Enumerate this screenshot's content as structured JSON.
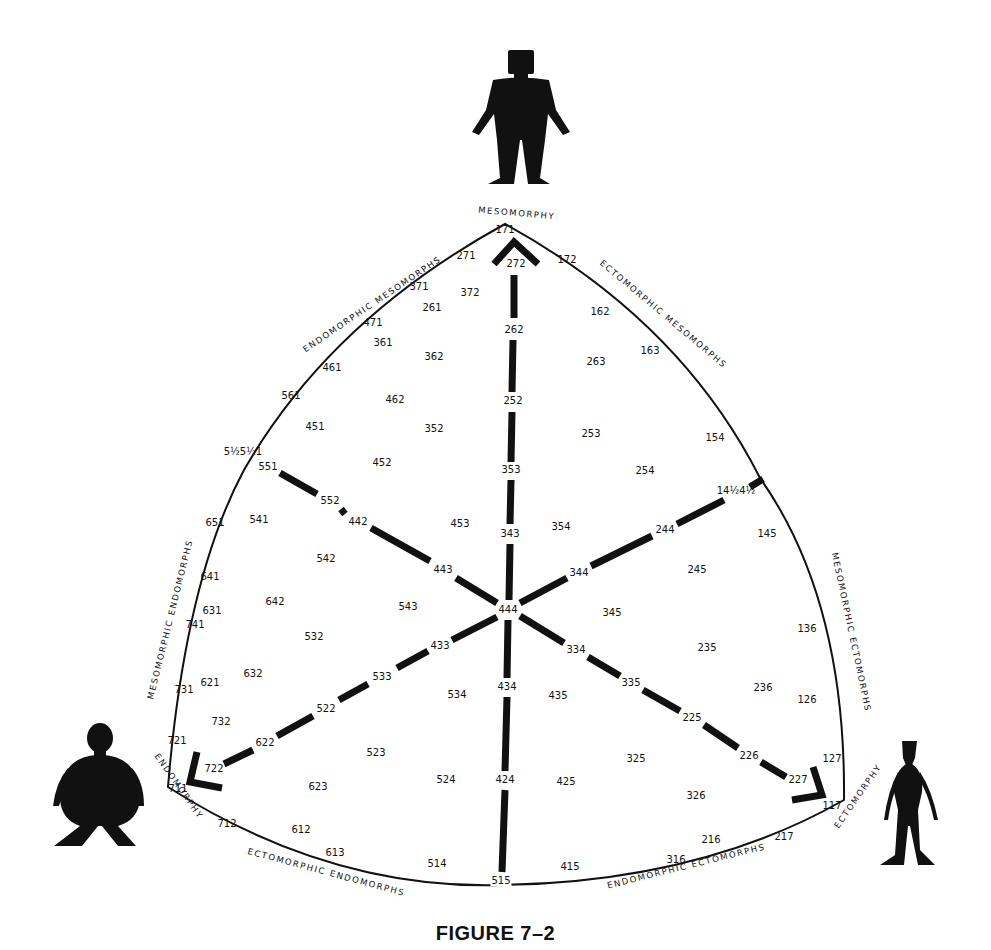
{
  "figure": {
    "caption": "FIGURE 7–2"
  },
  "poles": {
    "mesomorphy": {
      "label": "MESOMORPHY",
      "code": "171",
      "silhouette": "muscular-figure"
    },
    "endomorphy": {
      "label": "ENDOMORPHY",
      "code": "711",
      "silhouette": "round-figure"
    },
    "ectomorphy": {
      "label": "ECTOMORPHY",
      "code": "117",
      "silhouette": "thin-figure"
    }
  },
  "center": "444",
  "region_labels": {
    "endomorphic_mesomorphs": "ENDOMORPHIC  MESOMORPHS",
    "ectomorphic_mesomorphs": "ECTOMORPHIC  MESOMORPHS",
    "mesomorphic_endomorphs": "MESOMORPHIC  ENDOMORPHS",
    "mesomorphic_ectomorphs": "MESOMORPHIC  ECTOMORPHS",
    "ectomorphic_endomorphs": "ECTOMORPHIC  ENDOMORPHS",
    "endomorphic_ectomorphs": "ENDOMORPHIC  ECTOMORPHS"
  },
  "axes": {
    "to_mesomorphy": [
      "444",
      "343",
      "353",
      "252",
      "262",
      "272"
    ],
    "to_endomorphy": [
      "444",
      "433",
      "533",
      "522",
      "622",
      "722"
    ],
    "to_ectomorphy": [
      "444",
      "334",
      "335",
      "225",
      "226",
      "227"
    ],
    "to_endomorphic_mesomorph_edge": [
      "444",
      "443",
      "442",
      "552",
      "551"
    ],
    "to_mesomorphic_ectomorph_edge": [
      "444",
      "344",
      "244",
      "14½4½"
    ],
    "to_ectomorphic_endomorph_edge": [
      "444",
      "434",
      "424",
      "515"
    ]
  },
  "codes": [
    {
      "v": "171",
      "x": 505,
      "y": 230
    },
    {
      "v": "271",
      "x": 466,
      "y": 256
    },
    {
      "v": "172",
      "x": 567,
      "y": 260
    },
    {
      "v": "272",
      "x": 516,
      "y": 264,
      "bar": true
    },
    {
      "v": "371",
      "x": 419,
      "y": 287
    },
    {
      "v": "372",
      "x": 470,
      "y": 293
    },
    {
      "v": "261",
      "x": 432,
      "y": 308
    },
    {
      "v": "471",
      "x": 373,
      "y": 323
    },
    {
      "v": "262",
      "x": 514,
      "y": 330,
      "bar": true
    },
    {
      "v": "162",
      "x": 600,
      "y": 312
    },
    {
      "v": "361",
      "x": 383,
      "y": 343
    },
    {
      "v": "163",
      "x": 650,
      "y": 351
    },
    {
      "v": "362",
      "x": 434,
      "y": 357
    },
    {
      "v": "263",
      "x": 596,
      "y": 362
    },
    {
      "v": "461",
      "x": 332,
      "y": 368
    },
    {
      "v": "561",
      "x": 291,
      "y": 396
    },
    {
      "v": "462",
      "x": 395,
      "y": 400
    },
    {
      "v": "252",
      "x": 513,
      "y": 401,
      "bar": true
    },
    {
      "v": "451",
      "x": 315,
      "y": 427
    },
    {
      "v": "352",
      "x": 434,
      "y": 429
    },
    {
      "v": "253",
      "x": 591,
      "y": 434
    },
    {
      "v": "154",
      "x": 715,
      "y": 438
    },
    {
      "v": "5½5½1",
      "x": 243,
      "y": 452
    },
    {
      "v": "551",
      "x": 268,
      "y": 467,
      "bar": true
    },
    {
      "v": "452",
      "x": 382,
      "y": 463
    },
    {
      "v": "353",
      "x": 511,
      "y": 470,
      "bar": true
    },
    {
      "v": "254",
      "x": 645,
      "y": 471
    },
    {
      "v": "14½4½",
      "x": 736,
      "y": 491
    },
    {
      "v": "552",
      "x": 330,
      "y": 501,
      "bar": true
    },
    {
      "v": "442",
      "x": 358,
      "y": 522,
      "bar": true
    },
    {
      "v": "453",
      "x": 460,
      "y": 524
    },
    {
      "v": "354",
      "x": 561,
      "y": 527
    },
    {
      "v": "244",
      "x": 665,
      "y": 530,
      "bar": true
    },
    {
      "v": "343",
      "x": 510,
      "y": 534,
      "bar": true
    },
    {
      "v": "651",
      "x": 215,
      "y": 523
    },
    {
      "v": "541",
      "x": 259,
      "y": 520
    },
    {
      "v": "145",
      "x": 767,
      "y": 534
    },
    {
      "v": "542",
      "x": 326,
      "y": 559
    },
    {
      "v": "443",
      "x": 443,
      "y": 570,
      "bar": true
    },
    {
      "v": "245",
      "x": 697,
      "y": 570
    },
    {
      "v": "344",
      "x": 579,
      "y": 573,
      "bar": true
    },
    {
      "v": "641",
      "x": 210,
      "y": 577
    },
    {
      "v": "631",
      "x": 212,
      "y": 611
    },
    {
      "v": "642",
      "x": 275,
      "y": 602
    },
    {
      "v": "543",
      "x": 408,
      "y": 607
    },
    {
      "v": "444",
      "x": 508,
      "y": 610,
      "bar": true
    },
    {
      "v": "345",
      "x": 612,
      "y": 613
    },
    {
      "v": "741",
      "x": 195,
      "y": 625
    },
    {
      "v": "136",
      "x": 807,
      "y": 629
    },
    {
      "v": "532",
      "x": 314,
      "y": 637
    },
    {
      "v": "433",
      "x": 440,
      "y": 646,
      "bar": true
    },
    {
      "v": "334",
      "x": 576,
      "y": 650,
      "bar": true
    },
    {
      "v": "235",
      "x": 707,
      "y": 648
    },
    {
      "v": "621",
      "x": 210,
      "y": 683
    },
    {
      "v": "632",
      "x": 253,
      "y": 674
    },
    {
      "v": "533",
      "x": 382,
      "y": 677,
      "bar": true
    },
    {
      "v": "731",
      "x": 184,
      "y": 690
    },
    {
      "v": "335",
      "x": 631,
      "y": 683,
      "bar": true
    },
    {
      "v": "236",
      "x": 763,
      "y": 688
    },
    {
      "v": "534",
      "x": 457,
      "y": 695
    },
    {
      "v": "434",
      "x": 507,
      "y": 687,
      "bar": true
    },
    {
      "v": "435",
      "x": 558,
      "y": 696
    },
    {
      "v": "126",
      "x": 807,
      "y": 700
    },
    {
      "v": "732",
      "x": 221,
      "y": 722
    },
    {
      "v": "522",
      "x": 326,
      "y": 709,
      "bar": true
    },
    {
      "v": "225",
      "x": 692,
      "y": 718,
      "bar": true
    },
    {
      "v": "721",
      "x": 177,
      "y": 741
    },
    {
      "v": "622",
      "x": 265,
      "y": 743,
      "bar": true
    },
    {
      "v": "523",
      "x": 376,
      "y": 753
    },
    {
      "v": "226",
      "x": 749,
      "y": 756,
      "bar": true
    },
    {
      "v": "325",
      "x": 636,
      "y": 759
    },
    {
      "v": "127",
      "x": 832,
      "y": 759
    },
    {
      "v": "722",
      "x": 214,
      "y": 769
    },
    {
      "v": "424",
      "x": 505,
      "y": 780,
      "bar": true
    },
    {
      "v": "524",
      "x": 446,
      "y": 780
    },
    {
      "v": "425",
      "x": 566,
      "y": 782
    },
    {
      "v": "227",
      "x": 798,
      "y": 780,
      "bar": true
    },
    {
      "v": "711",
      "x": 178,
      "y": 789
    },
    {
      "v": "623",
      "x": 318,
      "y": 787
    },
    {
      "v": "326",
      "x": 696,
      "y": 796
    },
    {
      "v": "117",
      "x": 832,
      "y": 806
    },
    {
      "v": "712",
      "x": 227,
      "y": 824
    },
    {
      "v": "612",
      "x": 301,
      "y": 830
    },
    {
      "v": "216",
      "x": 711,
      "y": 840
    },
    {
      "v": "217",
      "x": 784,
      "y": 837
    },
    {
      "v": "613",
      "x": 335,
      "y": 853
    },
    {
      "v": "514",
      "x": 437,
      "y": 864
    },
    {
      "v": "316",
      "x": 676,
      "y": 860
    },
    {
      "v": "415",
      "x": 570,
      "y": 867
    },
    {
      "v": "515",
      "x": 501,
      "y": 881,
      "bar": true
    }
  ]
}
